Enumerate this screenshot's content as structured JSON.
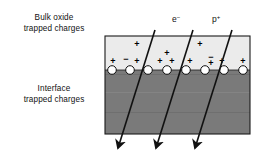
{
  "figure": {
    "width": 264,
    "height": 156,
    "background": "#ffffff"
  },
  "labels": {
    "bulk_oxide_line1": "Bulk oxide",
    "bulk_oxide_line2": "trapped charges",
    "interface_line1": "Interface",
    "interface_line2": "trapped charges"
  },
  "tracks": [
    {
      "name": "track-left",
      "label": "",
      "label_sup": "",
      "x1": 155,
      "y1": 32,
      "x2": 116,
      "y2": 148
    },
    {
      "name": "track-electron",
      "label": "e",
      "label_sup": "−",
      "label_x": 177,
      "label_y": 22,
      "x1": 193,
      "y1": 32,
      "x2": 154,
      "y2": 148
    },
    {
      "name": "track-proton",
      "label": "p",
      "label_sup": "+",
      "label_x": 217,
      "label_y": 22,
      "x1": 232,
      "y1": 32,
      "x2": 193,
      "y2": 148
    }
  ],
  "box": {
    "left": 105,
    "top": 36,
    "right": 250,
    "bottom": 134,
    "interface_y": 70,
    "oxide_color": "#ebebeb",
    "substrate_color": "#7a7a7a",
    "border_color": "#1a1a1a"
  },
  "interface_states": [
    {
      "name": "interface-circle-1",
      "cx": 112,
      "cy": 70
    },
    {
      "name": "interface-circle-2",
      "cx": 130,
      "cy": 70
    },
    {
      "name": "interface-circle-3",
      "cx": 148,
      "cy": 70
    },
    {
      "name": "interface-circle-4",
      "cx": 167,
      "cy": 70
    },
    {
      "name": "interface-circle-5",
      "cx": 186,
      "cy": 70
    },
    {
      "name": "interface-circle-6",
      "cx": 205,
      "cy": 70
    },
    {
      "name": "interface-circle-7",
      "cx": 224,
      "cy": 70
    },
    {
      "name": "interface-circle-8",
      "cx": 243,
      "cy": 70
    }
  ],
  "oxide_charges": [
    {
      "name": "oxide-charge-plus-a",
      "symbol": "+",
      "x": 137,
      "y": 45
    },
    {
      "name": "oxide-charge-plus-b",
      "symbol": "+",
      "x": 200,
      "y": 45
    },
    {
      "name": "oxide-charge-plus-c",
      "symbol": "+",
      "x": 167,
      "y": 54
    },
    {
      "name": "oxide-charge-plus-d",
      "symbol": "+",
      "x": 113,
      "y": 62
    },
    {
      "name": "oxide-charge-minus-a",
      "symbol": "−",
      "x": 126,
      "y": 60
    },
    {
      "name": "oxide-charge-plus-e",
      "symbol": "+",
      "x": 137,
      "y": 62
    },
    {
      "name": "oxide-charge-plus-f",
      "symbol": "+",
      "x": 160,
      "y": 62
    },
    {
      "name": "oxide-charge-plus-g",
      "symbol": "+",
      "x": 172,
      "y": 62
    },
    {
      "name": "oxide-charge-plus-h",
      "symbol": "+",
      "x": 190,
      "y": 62
    },
    {
      "name": "oxide-charge-minus-b",
      "symbol": "−",
      "x": 211,
      "y": 58
    },
    {
      "name": "oxide-charge-plus-i",
      "symbol": "+",
      "x": 211,
      "y": 63
    },
    {
      "name": "oxide-charge-plus-j",
      "symbol": "+",
      "x": 222,
      "y": 62
    },
    {
      "name": "oxide-charge-plus-k",
      "symbol": "+",
      "x": 243,
      "y": 62
    }
  ]
}
